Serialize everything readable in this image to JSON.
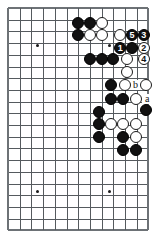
{
  "diagram": {
    "kind": "go-board-diagram",
    "board": {
      "cols": 13,
      "rows": 20,
      "origin_x": 8,
      "origin_y": 8,
      "spacing": 11.7,
      "line_color": "#555a5e",
      "edge_color": "#6d7276",
      "background": "#ffffff",
      "stone_radius": 6.0
    },
    "star_points": [
      {
        "col": 2.5,
        "row": 3.2,
        "name": "star-point-upper-left"
      },
      {
        "col": 8.7,
        "row": 3.2,
        "name": "star-point-upper-right"
      },
      {
        "col": 2.5,
        "row": 15.7,
        "name": "star-point-lower-left"
      },
      {
        "col": 8.7,
        "row": 15.7,
        "name": "star-point-lower-right"
      }
    ],
    "stones": [
      {
        "col": 6.0,
        "row": 1.3,
        "color": "black",
        "name": "black-stone"
      },
      {
        "col": 7.0,
        "row": 1.3,
        "color": "black",
        "name": "black-stone"
      },
      {
        "col": 8.0,
        "row": 1.3,
        "color": "white",
        "name": "white-stone"
      },
      {
        "col": 6.0,
        "row": 2.3,
        "color": "black",
        "name": "black-stone"
      },
      {
        "col": 7.0,
        "row": 2.3,
        "color": "white",
        "name": "white-stone"
      },
      {
        "col": 8.0,
        "row": 2.3,
        "color": "white",
        "name": "white-stone"
      },
      {
        "col": 9.6,
        "row": 2.3,
        "color": "white",
        "name": "white-stone"
      },
      {
        "col": 10.6,
        "row": 2.3,
        "color": "black",
        "name": "numbered-stone-5"
      },
      {
        "col": 11.6,
        "row": 2.3,
        "color": "black",
        "name": "numbered-stone-3"
      },
      {
        "col": 9.6,
        "row": 3.4,
        "color": "black",
        "name": "numbered-stone-1"
      },
      {
        "col": 10.6,
        "row": 3.4,
        "color": "black",
        "name": "black-stone"
      },
      {
        "col": 11.6,
        "row": 3.4,
        "color": "white",
        "name": "numbered-stone-2"
      },
      {
        "col": 7.0,
        "row": 4.4,
        "color": "black",
        "name": "black-stone"
      },
      {
        "col": 8.0,
        "row": 4.4,
        "color": "black",
        "name": "black-stone"
      },
      {
        "col": 9.0,
        "row": 4.4,
        "color": "black",
        "name": "black-stone"
      },
      {
        "col": 10.2,
        "row": 4.4,
        "color": "white",
        "name": "white-stone"
      },
      {
        "col": 11.6,
        "row": 4.4,
        "color": "white",
        "name": "numbered-stone-4"
      },
      {
        "col": 10.2,
        "row": 5.5,
        "color": "white",
        "name": "white-stone"
      },
      {
        "col": 8.8,
        "row": 6.6,
        "color": "black",
        "name": "black-stone"
      },
      {
        "col": 10.0,
        "row": 6.6,
        "color": "white",
        "name": "white-stone"
      },
      {
        "col": 11.8,
        "row": 6.6,
        "color": "white",
        "name": "white-stone"
      },
      {
        "col": 8.8,
        "row": 7.8,
        "color": "black",
        "name": "black-stone"
      },
      {
        "col": 9.8,
        "row": 7.8,
        "color": "black",
        "name": "black-stone"
      },
      {
        "col": 10.9,
        "row": 7.8,
        "color": "white",
        "name": "white-stone"
      },
      {
        "col": 7.8,
        "row": 8.9,
        "color": "black",
        "name": "black-stone"
      },
      {
        "col": 11.8,
        "row": 8.7,
        "color": "black",
        "name": "black-stone"
      },
      {
        "col": 7.8,
        "row": 9.9,
        "color": "black",
        "name": "black-stone"
      },
      {
        "col": 8.8,
        "row": 9.9,
        "color": "white",
        "name": "white-stone"
      },
      {
        "col": 9.8,
        "row": 9.9,
        "color": "white",
        "name": "white-stone"
      },
      {
        "col": 10.9,
        "row": 9.9,
        "color": "white",
        "name": "white-stone"
      },
      {
        "col": 7.8,
        "row": 11.0,
        "color": "black",
        "name": "black-stone"
      },
      {
        "col": 9.8,
        "row": 11.0,
        "color": "black",
        "name": "black-stone"
      },
      {
        "col": 10.9,
        "row": 11.0,
        "color": "white",
        "name": "white-stone"
      },
      {
        "col": 9.8,
        "row": 12.1,
        "color": "black",
        "name": "black-stone"
      },
      {
        "col": 10.9,
        "row": 12.1,
        "color": "black",
        "name": "black-stone"
      }
    ],
    "move_numbers": [
      {
        "label": "1",
        "col": 9.6,
        "row": 3.4,
        "on": "black",
        "name": "move-number-1"
      },
      {
        "label": "2",
        "col": 11.6,
        "row": 3.4,
        "on": "white",
        "name": "move-number-2"
      },
      {
        "label": "3",
        "col": 11.6,
        "row": 2.3,
        "on": "black",
        "name": "move-number-3"
      },
      {
        "label": "4",
        "col": 11.6,
        "row": 4.4,
        "on": "white",
        "name": "move-number-4"
      },
      {
        "label": "5",
        "col": 10.6,
        "row": 2.3,
        "on": "black",
        "name": "move-number-5"
      }
    ],
    "point_labels": [
      {
        "label": "b",
        "col": 10.9,
        "row": 6.6,
        "name": "point-label-b"
      },
      {
        "label": "a",
        "col": 11.9,
        "row": 7.8,
        "name": "point-label-a"
      }
    ]
  }
}
